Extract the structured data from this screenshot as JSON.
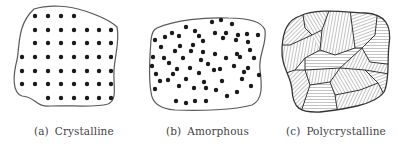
{
  "figure": {
    "panels": [
      {
        "id": "a",
        "tag": "(a)",
        "label": "Crystalline",
        "type": "ordered-lattice",
        "dot_rows": [
          {
            "y": 16,
            "xs": [
              35,
              48,
              61,
              74
            ]
          },
          {
            "y": 30,
            "xs": [
              35,
              48,
              61,
              74,
              87,
              99,
              111
            ]
          },
          {
            "y": 43,
            "xs": [
              35,
              48,
              61,
              74,
              87,
              99,
              111
            ]
          },
          {
            "y": 57,
            "xs": [
              22,
              35,
              48,
              61,
              74,
              87,
              99,
              111
            ]
          },
          {
            "y": 71,
            "xs": [
              22,
              35,
              48,
              61,
              74,
              87,
              99,
              111
            ]
          },
          {
            "y": 84,
            "xs": [
              22,
              35,
              48,
              61,
              74,
              87,
              99,
              111
            ]
          },
          {
            "y": 98,
            "xs": [
              48,
              61,
              74,
              87,
              99,
              111
            ]
          }
        ]
      },
      {
        "id": "b",
        "tag": "(b)",
        "label": "Amorphous",
        "type": "random-dots",
        "dots": [
          [
            212,
            22
          ],
          [
            221,
            20
          ],
          [
            232,
            24
          ],
          [
            186,
            27
          ],
          [
            195,
            31
          ],
          [
            172,
            33
          ],
          [
            155,
            40
          ],
          [
            165,
            37
          ],
          [
            179,
            36
          ],
          [
            199,
            36
          ],
          [
            215,
            33
          ],
          [
            226,
            33
          ],
          [
            238,
            35
          ],
          [
            247,
            34
          ],
          [
            258,
            35
          ],
          [
            161,
            47
          ],
          [
            180,
            46
          ],
          [
            193,
            45
          ],
          [
            203,
            41
          ],
          [
            223,
            38
          ],
          [
            236,
            40
          ],
          [
            248,
            42
          ],
          [
            175,
            51
          ],
          [
            191,
            51
          ],
          [
            203,
            52
          ],
          [
            215,
            54
          ],
          [
            237,
            54
          ],
          [
            250,
            50
          ],
          [
            153,
            57
          ],
          [
            164,
            58
          ],
          [
            183,
            58
          ],
          [
            201,
            60
          ],
          [
            226,
            58
          ],
          [
            240,
            57
          ],
          [
            254,
            58
          ],
          [
            152,
            66
          ],
          [
            169,
            63
          ],
          [
            177,
            69
          ],
          [
            190,
            68
          ],
          [
            208,
            64
          ],
          [
            220,
            69
          ],
          [
            234,
            66
          ],
          [
            248,
            68
          ],
          [
            156,
            74
          ],
          [
            173,
            74
          ],
          [
            199,
            73
          ],
          [
            214,
            70
          ],
          [
            244,
            72
          ],
          [
            259,
            75
          ],
          [
            160,
            81
          ],
          [
            168,
            80
          ],
          [
            186,
            79
          ],
          [
            204,
            82
          ],
          [
            222,
            81
          ],
          [
            242,
            79
          ],
          [
            155,
            89
          ],
          [
            179,
            86
          ],
          [
            194,
            88
          ],
          [
            206,
            88
          ],
          [
            216,
            90
          ],
          [
            237,
            92
          ],
          [
            251,
            86
          ],
          [
            176,
            101
          ],
          [
            186,
            103
          ],
          [
            195,
            101
          ],
          [
            206,
            101
          ],
          [
            227,
            96
          ]
        ]
      },
      {
        "id": "c",
        "tag": "(c)",
        "label": "Polycrystalline",
        "type": "hatched-grains"
      }
    ],
    "colors": {
      "outline": "#5a5a5a",
      "dot": "#1a1a1a",
      "hatch": "#6a6a6a",
      "caption": "#444444"
    }
  }
}
